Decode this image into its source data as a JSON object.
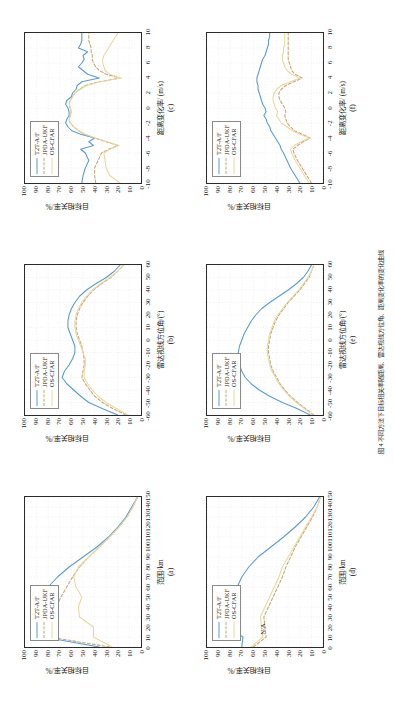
{
  "figure": {
    "caption": "图 4  不同方法下目标相关率随距离、雷达视线方位角、距离变化率的变化曲线",
    "series_names": [
      "T2T-A/F",
      "JPDA-UKF",
      "OS-CFAR"
    ],
    "colors": {
      "t2t_af": "#5b9bd5",
      "jpda_ukf": "#c8a678",
      "os_cfar": "#e8d9a0",
      "axis": "#2b2b2b",
      "grid": "#d9d9d9",
      "text": "#1a1a1a"
    },
    "ylabel": "目标相关率/%",
    "annotations": {
      "na": "N/A"
    }
  },
  "chart_data": [
    {
      "id": "a",
      "type": "line",
      "panel_label": "(a)",
      "title": "",
      "xlabel": "范围/km",
      "ylabel": "目标相关率/%",
      "xlim": [
        0,
        150
      ],
      "ylim": [
        0,
        100
      ],
      "xticks": [
        0,
        10,
        20,
        30,
        40,
        50,
        60,
        70,
        80,
        90,
        100,
        110,
        120,
        130,
        140,
        150
      ],
      "yticks": [
        0,
        10,
        20,
        30,
        40,
        50,
        60,
        70,
        80,
        90,
        100
      ],
      "grid": true,
      "legend_position": "top-left",
      "x": [
        0,
        10,
        20,
        30,
        40,
        50,
        60,
        70,
        80,
        90,
        100,
        110,
        120,
        130,
        140,
        150
      ],
      "series": [
        {
          "name": "T2T-A/F",
          "values": [
            36,
            84,
            83,
            92,
            90,
            86,
            80,
            72,
            62,
            50,
            38,
            28,
            20,
            13,
            8,
            3
          ]
        },
        {
          "name": "JPDA-UKF",
          "values": [
            27,
            79,
            78,
            76,
            73,
            69,
            64,
            59,
            53,
            45,
            36,
            27,
            19,
            12,
            7,
            3
          ]
        },
        {
          "name": "OS-CFAR",
          "values": [
            25,
            41,
            41,
            53,
            54,
            51,
            56,
            58,
            54,
            45,
            36,
            27,
            19,
            12,
            7,
            3
          ]
        }
      ]
    },
    {
      "id": "b",
      "type": "line",
      "panel_label": "(b)",
      "title": "",
      "xlabel": "雷达视线方位角/(°)",
      "ylabel": "目标相关率/%",
      "xlim": [
        -60,
        60
      ],
      "ylim": [
        0,
        100
      ],
      "xticks": [
        -60,
        -50,
        -40,
        -30,
        -20,
        -10,
        0,
        10,
        20,
        30,
        40,
        50,
        60
      ],
      "yticks": [
        0,
        10,
        20,
        30,
        40,
        50,
        60,
        70,
        80,
        90,
        100
      ],
      "grid": true,
      "legend_position": "top-left",
      "x": [
        -60,
        -55,
        -50,
        -45,
        -40,
        -35,
        -30,
        -25,
        -20,
        -15,
        -10,
        -5,
        0,
        5,
        10,
        15,
        20,
        25,
        30,
        35,
        40,
        45,
        50,
        55,
        60
      ],
      "series": [
        {
          "name": "T2T-A/F",
          "values": [
            20,
            33,
            45,
            52,
            58,
            64,
            68,
            66,
            62,
            59,
            57,
            57,
            59,
            61,
            63,
            63,
            62,
            60,
            57,
            53,
            47,
            39,
            30,
            23,
            18
          ]
        },
        {
          "name": "JPDA-UKF",
          "values": [
            13,
            24,
            33,
            40,
            44,
            48,
            51,
            50,
            49,
            49,
            50,
            51,
            53,
            55,
            56,
            56,
            55,
            53,
            50,
            46,
            41,
            34,
            26,
            20,
            15
          ]
        },
        {
          "name": "OS-CFAR",
          "values": [
            11,
            21,
            30,
            37,
            42,
            46,
            49,
            49,
            48,
            48,
            50,
            52,
            54,
            56,
            57,
            57,
            56,
            54,
            51,
            47,
            42,
            35,
            27,
            20,
            15
          ]
        }
      ]
    },
    {
      "id": "c",
      "type": "line",
      "panel_label": "(c)",
      "title": "",
      "xlabel": "距离变化率/ (m/s)",
      "ylabel": "目标相关率/%",
      "xlim": [
        -10,
        10
      ],
      "ylim": [
        0,
        100
      ],
      "xticks": [
        -10,
        -8,
        -6,
        -4,
        -2,
        0,
        2,
        4,
        6,
        8,
        10
      ],
      "yticks": [
        0,
        10,
        20,
        30,
        40,
        50,
        60,
        70,
        80,
        90,
        100
      ],
      "grid": true,
      "legend_position": "top-left",
      "x": [
        -10,
        -9,
        -8,
        -7,
        -6,
        -5.5,
        -5,
        -4.5,
        -4,
        -3.5,
        -3,
        -2.5,
        -2,
        -1.5,
        -1,
        -0.5,
        0,
        0.5,
        1,
        1.5,
        2,
        2.5,
        3,
        3.5,
        4,
        4.5,
        5,
        5.5,
        6,
        6.5,
        7,
        7.5,
        8,
        8.5,
        9,
        9.5,
        10
      ],
      "series": [
        {
          "name": "T2T-A/F",
          "values": [
            51,
            50,
            48,
            45,
            48,
            52,
            41,
            45,
            40,
            52,
            60,
            63,
            65,
            64,
            62,
            62,
            63,
            65,
            64,
            60,
            59,
            56,
            55,
            51,
            36,
            46,
            50,
            54,
            51,
            49,
            50,
            46,
            54,
            52,
            51,
            51,
            51
          ]
        },
        {
          "name": "JPDA-UKF",
          "values": [
            39,
            40,
            40,
            37,
            34,
            28,
            20,
            30,
            40,
            49,
            54,
            58,
            61,
            62,
            61,
            60,
            61,
            62,
            61,
            59,
            57,
            53,
            48,
            36,
            18,
            30,
            36,
            39,
            41,
            42,
            42,
            43,
            43,
            44,
            45,
            45,
            45
          ]
        },
        {
          "name": "OS-CFAR",
          "values": [
            18,
            27,
            30,
            31,
            32,
            27,
            19,
            29,
            39,
            48,
            54,
            58,
            61,
            62,
            61,
            60,
            61,
            62,
            61,
            59,
            57,
            52,
            47,
            35,
            17,
            27,
            31,
            32,
            33,
            33,
            32,
            30,
            28,
            26,
            24,
            22,
            20
          ]
        }
      ]
    },
    {
      "id": "d",
      "type": "line",
      "panel_label": "(d)",
      "title": "",
      "xlabel": "范围/km",
      "ylabel": "目标相关率/%",
      "xlim": [
        0,
        150
      ],
      "ylim": [
        0,
        100
      ],
      "xticks": [
        0,
        10,
        20,
        30,
        40,
        50,
        60,
        70,
        80,
        90,
        100,
        110,
        120,
        130,
        140,
        150
      ],
      "yticks": [
        0,
        10,
        20,
        30,
        40,
        50,
        60,
        70,
        80,
        90,
        100
      ],
      "grid": true,
      "legend_position": "top-left",
      "annotation_na": "N/A",
      "x": [
        0,
        10,
        20,
        30,
        40,
        50,
        60,
        70,
        80,
        90,
        100,
        110,
        120,
        130,
        140,
        150
      ],
      "series": [
        {
          "name": "T2T-A/F",
          "values": [
            70,
            69,
            83,
            82,
            80,
            79,
            74,
            70,
            64,
            56,
            45,
            34,
            24,
            15,
            8,
            3
          ]
        },
        {
          "name": "JPDA-UKF",
          "values": [
            60,
            49,
            50,
            51,
            47,
            43,
            39,
            35,
            32,
            28,
            24,
            19,
            14,
            9,
            5,
            2
          ]
        },
        {
          "name": "OS-CFAR",
          "values": [
            62,
            52,
            53,
            54,
            50,
            46,
            42,
            38,
            35,
            30,
            25,
            20,
            15,
            10,
            5,
            2
          ]
        }
      ]
    },
    {
      "id": "e",
      "type": "line",
      "panel_label": "(e)",
      "title": "",
      "xlabel": "雷达视线方位角/(°)",
      "ylabel": "目标相关率/%",
      "xlim": [
        -60,
        60
      ],
      "ylim": [
        0,
        100
      ],
      "xticks": [
        -60,
        -50,
        -40,
        -30,
        -20,
        -10,
        0,
        10,
        20,
        30,
        40,
        50,
        60
      ],
      "yticks": [
        0,
        10,
        20,
        30,
        40,
        50,
        60,
        70,
        80,
        90,
        100
      ],
      "grid": true,
      "legend_position": "top-left",
      "x": [
        -60,
        -55,
        -50,
        -45,
        -40,
        -35,
        -30,
        -25,
        -20,
        -15,
        -10,
        -5,
        0,
        5,
        10,
        15,
        20,
        25,
        30,
        35,
        40,
        45,
        50,
        55,
        60
      ],
      "series": [
        {
          "name": "T2T-A/F",
          "values": [
            11,
            22,
            35,
            46,
            55,
            62,
            67,
            70,
            72,
            73,
            73,
            72,
            70,
            68,
            65,
            62,
            58,
            53,
            46,
            38,
            30,
            23,
            17,
            13,
            10
          ]
        },
        {
          "name": "JPDA-UKF",
          "values": [
            8,
            15,
            22,
            28,
            33,
            37,
            40,
            43,
            45,
            46,
            47,
            47,
            46,
            45,
            43,
            41,
            38,
            34,
            30,
            25,
            20,
            16,
            12,
            10,
            8
          ]
        },
        {
          "name": "OS-CFAR",
          "values": [
            9,
            16,
            23,
            29,
            34,
            38,
            41,
            44,
            46,
            47,
            48,
            48,
            47,
            46,
            44,
            42,
            39,
            35,
            31,
            26,
            21,
            17,
            13,
            10,
            8
          ]
        }
      ]
    },
    {
      "id": "f",
      "type": "line",
      "panel_label": "(f)",
      "title": "",
      "xlabel": "距离变化率/ (m/s)",
      "ylabel": "目标相关率/%",
      "xlim": [
        -10,
        10
      ],
      "ylim": [
        0,
        100
      ],
      "xticks": [
        -10,
        -8,
        -6,
        -4,
        -2,
        0,
        2,
        4,
        6,
        8,
        10
      ],
      "yticks": [
        0,
        10,
        20,
        30,
        40,
        50,
        60,
        70,
        80,
        90,
        100
      ],
      "grid": true,
      "legend_position": "top-left",
      "x": [
        -10,
        -9,
        -8,
        -7,
        -6,
        -5.5,
        -5,
        -4.5,
        -4,
        -3.5,
        -3,
        -2.5,
        -2,
        -1.5,
        -1,
        -0.5,
        0,
        0.5,
        1,
        1.5,
        2,
        2.5,
        3,
        3.5,
        4,
        4.5,
        5,
        5.5,
        6,
        6.5,
        7,
        7.5,
        8,
        8.5,
        9,
        9.5,
        10
      ],
      "series": [
        {
          "name": "T2T-A/F",
          "values": [
            20,
            24,
            28,
            31,
            34,
            36,
            37,
            39,
            41,
            43,
            45,
            46,
            48,
            49,
            51,
            49,
            50,
            52,
            53,
            54,
            55,
            56,
            56,
            57,
            57,
            56,
            55,
            54,
            53,
            52,
            50,
            49,
            48,
            47,
            47,
            46,
            46
          ]
        },
        {
          "name": "JPDA-UKF",
          "values": [
            10,
            14,
            18,
            22,
            25,
            26,
            22,
            17,
            11,
            18,
            25,
            28,
            31,
            32,
            33,
            32,
            33,
            35,
            37,
            38,
            38,
            36,
            32,
            25,
            18,
            24,
            27,
            28,
            29,
            30,
            30,
            30,
            30,
            30,
            30,
            30,
            30
          ]
        },
        {
          "name": "OS-CFAR",
          "values": [
            12,
            16,
            20,
            24,
            27,
            28,
            25,
            19,
            12,
            20,
            27,
            31,
            36,
            38,
            40,
            39,
            41,
            42,
            43,
            43,
            42,
            40,
            36,
            28,
            20,
            27,
            31,
            33,
            34,
            35,
            35,
            34,
            34,
            33,
            33,
            33,
            33
          ]
        }
      ]
    }
  ]
}
